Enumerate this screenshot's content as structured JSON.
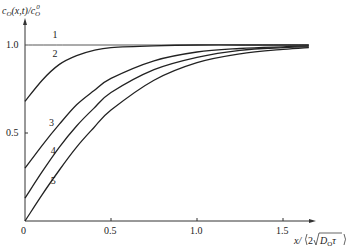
{
  "chart_data": {
    "type": "line",
    "title": "",
    "ylabel": "c_O(x,t)/c_O^0",
    "xlabel": "x/(2√(D_O τ))",
    "xlim": [
      0,
      1.7
    ],
    "ylim": [
      0,
      1.1
    ],
    "x_ticks": [
      "0",
      "0.5",
      "1.0",
      "1.5"
    ],
    "y_ticks": [
      "0.5",
      "1.0"
    ],
    "grid": false,
    "legend": "inline curve labels 1-5",
    "series": [
      {
        "name": "1",
        "x": [
          0,
          0.25,
          0.5,
          0.75,
          1.0,
          1.25,
          1.5,
          1.65
        ],
        "values": [
          1.0,
          1.0,
          1.0,
          1.0,
          1.0,
          1.0,
          1.0,
          1.0
        ]
      },
      {
        "name": "2",
        "x": [
          0,
          0.1,
          0.2,
          0.3,
          0.4,
          0.5,
          0.75,
          1.0,
          1.25,
          1.5,
          1.65
        ],
        "values": [
          0.68,
          0.8,
          0.89,
          0.94,
          0.97,
          0.985,
          0.995,
          1.0,
          1.0,
          1.0,
          1.0
        ]
      },
      {
        "name": "3",
        "x": [
          0,
          0.1,
          0.2,
          0.3,
          0.4,
          0.5,
          0.75,
          1.0,
          1.25,
          1.5,
          1.65
        ],
        "values": [
          0.3,
          0.43,
          0.55,
          0.66,
          0.74,
          0.81,
          0.91,
          0.96,
          0.98,
          0.99,
          0.995
        ]
      },
      {
        "name": "4",
        "x": [
          0,
          0.1,
          0.2,
          0.3,
          0.4,
          0.5,
          0.75,
          1.0,
          1.25,
          1.5,
          1.65
        ],
        "values": [
          0.13,
          0.28,
          0.42,
          0.54,
          0.64,
          0.73,
          0.86,
          0.93,
          0.97,
          0.985,
          0.99
        ]
      },
      {
        "name": "5",
        "x": [
          0,
          0.1,
          0.2,
          0.3,
          0.4,
          0.5,
          0.75,
          1.0,
          1.25,
          1.5,
          1.65
        ],
        "values": [
          0.0,
          0.15,
          0.29,
          0.42,
          0.53,
          0.63,
          0.8,
          0.9,
          0.95,
          0.975,
          0.985
        ]
      }
    ],
    "curve_labels": [
      {
        "text": "1",
        "x": 0.16,
        "y": 1.04
      },
      {
        "text": "2",
        "x": 0.16,
        "y": 0.93
      },
      {
        "text": "3",
        "x": 0.14,
        "y": 0.54
      },
      {
        "text": "4",
        "x": 0.15,
        "y": 0.38
      },
      {
        "text": "5",
        "x": 0.15,
        "y": 0.21
      }
    ]
  },
  "axes": {
    "origin_label": "0",
    "y_tick_05": "0.5",
    "y_tick_10": "1.0",
    "x_tick_05": "0.5",
    "x_tick_10": "1.0",
    "x_tick_15": "1.5"
  }
}
